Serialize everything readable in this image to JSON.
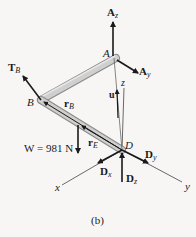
{
  "figure": {
    "caption": "(b)",
    "colors": {
      "background": "#f7f6f5",
      "rod": "#c9c9c9",
      "rod_edge": "#8a8a8a",
      "ink": "#1a1a1a"
    },
    "points": {
      "A": "A",
      "B": "B",
      "D": "D"
    },
    "forces": {
      "Az": {
        "main": "A",
        "sub": "z"
      },
      "Ay": {
        "main": "A",
        "sub": "y"
      },
      "TB": {
        "main": "T",
        "sub": "B"
      },
      "Dx": {
        "main": "D",
        "sub": "x"
      },
      "Dy": {
        "main": "D",
        "sub": "y"
      },
      "Dz": {
        "main": "D",
        "sub": "z"
      },
      "W": "W = 981 N"
    },
    "vectors": {
      "rB": {
        "main": "r",
        "sub": "B"
      },
      "rE": {
        "main": "r",
        "sub": "E"
      },
      "u": "u"
    },
    "axes": {
      "x": "x",
      "y": "y",
      "z": "z"
    }
  }
}
